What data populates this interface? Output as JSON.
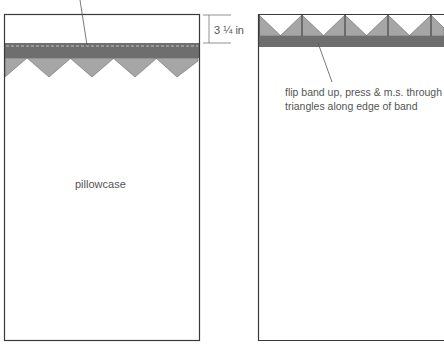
{
  "diagram": {
    "left_panel": {
      "label": "pillowcase",
      "dimension_label": "3 ¼ in",
      "band_triangle_count": 4
    },
    "right_panel": {
      "note_line1": "flip band up, press & m.s. through",
      "note_line2": "triangles along edge of band"
    },
    "colors": {
      "outline": "#3a3a3a",
      "band": "#6e6e6e",
      "triangle": "#a6a6a6",
      "text": "#555555",
      "stitch": "#d8d8d8"
    }
  }
}
